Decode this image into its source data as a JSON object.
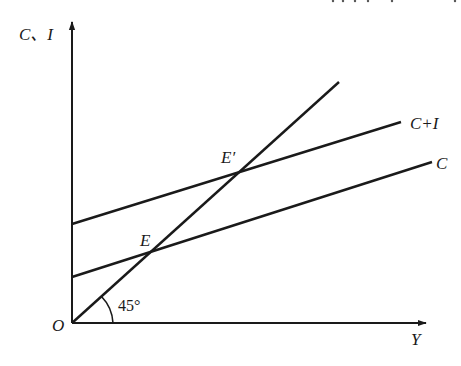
{
  "diagram": {
    "type": "keynesian-cross",
    "axes": {
      "y_label": "C、I",
      "x_label": "Y",
      "origin_label": "O"
    },
    "lines": [
      {
        "id": "forty-five",
        "label": "",
        "from": [
          72,
          323
        ],
        "to": [
          339,
          82
        ]
      },
      {
        "id": "c-plus-i",
        "label": "C+I",
        "from": [
          72,
          224
        ],
        "to": [
          401,
          122
        ]
      },
      {
        "id": "c",
        "label": "C",
        "from": [
          72,
          277
        ],
        "to": [
          432,
          162
        ]
      }
    ],
    "points": {
      "E": "E",
      "E_prime": "E′"
    },
    "angle_label": "45°",
    "colors": {
      "ink": "#1a1a1a",
      "background": "#ffffff"
    }
  }
}
